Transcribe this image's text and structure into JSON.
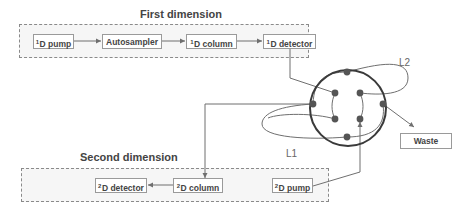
{
  "diagram": {
    "type": "2D-LC instrument schematic with 8-port switching valve",
    "first_dimension": {
      "title": "First dimension",
      "nodes": [
        {
          "prefix": "1",
          "label": "D pump"
        },
        {
          "prefix": "",
          "label": "Autosampler"
        },
        {
          "prefix": "1",
          "label": "D column"
        },
        {
          "prefix": "1",
          "label": "D detector"
        }
      ]
    },
    "second_dimension": {
      "title": "Second dimension",
      "nodes": [
        {
          "prefix": "2",
          "label": "D detector"
        },
        {
          "prefix": "2",
          "label": "D column"
        },
        {
          "prefix": "2",
          "label": "D pump"
        }
      ]
    },
    "valve": {
      "ports": 8,
      "loops": [
        "L1",
        "L2"
      ],
      "outlet": "Waste"
    },
    "connections": [
      "1D pump -> Autosampler",
      "Autosampler -> 1D column",
      "1D column -> 1D detector",
      "1D detector -> valve",
      "valve -> 2D column",
      "2D column -> 2D detector",
      "2D pump -> valve",
      "valve -> Waste"
    ],
    "colors": {
      "line": "#6f6f6f",
      "valve_ring": "#3a3a3a",
      "port": "#555555",
      "box_border": "#9a9a9a",
      "dashed_border": "#8a8a8a"
    }
  }
}
